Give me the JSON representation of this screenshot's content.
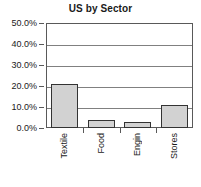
{
  "chart_data": {
    "type": "bar",
    "title": "US by Sector",
    "xlabel": "",
    "ylabel": "",
    "categories": [
      "Textile",
      "Food",
      "Engin",
      "Stores"
    ],
    "values": [
      21.0,
      4.0,
      3.0,
      11.0
    ],
    "ylim": [
      0,
      50
    ],
    "ytick_labels": [
      "0.0%",
      "10.0%",
      "20.0%",
      "30.0%",
      "40.0%",
      "50.0%"
    ],
    "ytick_values": [
      0,
      10,
      20,
      30,
      40,
      50
    ],
    "grid": true,
    "legend": false,
    "series": [
      {
        "name": "US by Sector",
        "values": [
          21.0,
          4.0,
          3.0,
          11.0
        ]
      }
    ],
    "colors": {
      "bar_fill": "#d2d2d2",
      "bar_border": "#333333",
      "gridline": "#808080",
      "axis": "#595959",
      "text": "#1a1a1a",
      "background": "#ffffff"
    }
  }
}
